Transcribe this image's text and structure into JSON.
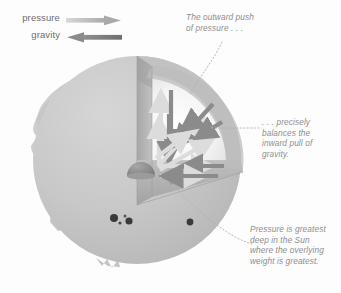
{
  "legend": {
    "items": [
      {
        "label": "pressure",
        "direction": "right",
        "color": "#b9b9b9",
        "icon": "arrow-right-icon"
      },
      {
        "label": "gravity",
        "direction": "left",
        "color": "#8a8a8a",
        "icon": "arrow-left-icon"
      }
    ]
  },
  "annotations": {
    "top": "The outward push\nof pressure . . .",
    "right": ". . . precisely\nbalances the\ninward pull of\ngravity.",
    "bottom": "Pressure is greatest\ndeep in the Sun\nwhere the overlying\nweight is greatest."
  },
  "diagram": {
    "sphere": {
      "cx": 137,
      "cy": 160,
      "r": 104,
      "fill": "#c9c9c9"
    },
    "core": {
      "cx": 140,
      "cy": 168,
      "r": 13,
      "fill": "#8f8f8f",
      "label": "core"
    },
    "interior_fill": "#f4f4f4",
    "cut_face_fill": "#b4b4b4",
    "pressure_arrow_color": "#d8d8d8",
    "gravity_arrow_color": "#8d8d8d",
    "sunspots": 4,
    "prominences": "left-edge-and-bottom",
    "leader_line_style": "dotted"
  }
}
